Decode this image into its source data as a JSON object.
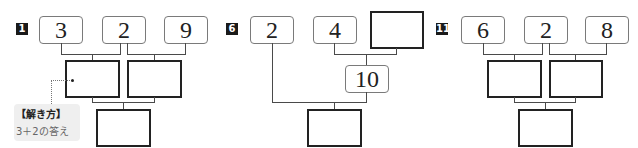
{
  "problems": [
    {
      "badge": "1",
      "top_values": [
        "3",
        "2",
        "9"
      ],
      "middle_boxes": [
        "",
        ""
      ],
      "bottom_box": "",
      "hint": {
        "title": "【解き方】",
        "text": "3＋2の答え"
      }
    },
    {
      "badge": "6",
      "top_values": [
        "2",
        "4",
        ""
      ],
      "middle_value": "10",
      "bottom_box": ""
    },
    {
      "badge": "11",
      "top_values": [
        "6",
        "2",
        "8"
      ],
      "middle_boxes": [
        "",
        ""
      ],
      "bottom_box": ""
    }
  ],
  "colors": {
    "badge_bg": "#1a1a1a",
    "box_border": "#7a7a7a",
    "blank_border": "#222222",
    "hint_bg": "#efefef"
  }
}
